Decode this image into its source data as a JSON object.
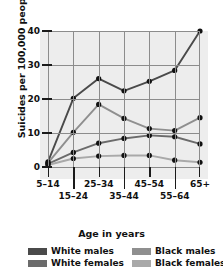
{
  "chart_data": {
    "type": "line",
    "title": "",
    "xlabel": "Age in years",
    "ylabel": "Suicides per 100,000 people",
    "categories": [
      "5–14",
      "15–24",
      "25–34",
      "35–44",
      "45–54",
      "55–64",
      "65+"
    ],
    "yticks": [
      0,
      10,
      20,
      30,
      40
    ],
    "ylim": [
      0,
      40
    ],
    "grid": true,
    "legend_position": "bottom",
    "series": [
      {
        "name": "White males",
        "color": "#4a4a4a",
        "values": [
          1.5,
          20.2,
          26.0,
          22.4,
          25.2,
          28.4,
          40.0
        ]
      },
      {
        "name": "Black males",
        "color": "#8f8f8f",
        "values": [
          1.2,
          10.2,
          18.4,
          14.3,
          11.3,
          10.7,
          14.5
        ]
      },
      {
        "name": "White females",
        "color": "#6b6b6b",
        "values": [
          0.9,
          4.3,
          7.0,
          8.4,
          9.3,
          8.9,
          6.8
        ]
      },
      {
        "name": "Black females",
        "color": "#a9a9a9",
        "values": [
          0.6,
          2.5,
          3.2,
          3.4,
          3.4,
          2.0,
          1.4
        ]
      }
    ]
  },
  "legend": {
    "items": [
      {
        "label": "White males",
        "color": "#4a4a4a"
      },
      {
        "label": "Black males",
        "color": "#8f8f8f"
      },
      {
        "label": "White females",
        "color": "#6b6b6b"
      },
      {
        "label": "Black females",
        "color": "#a9a9a9"
      }
    ]
  },
  "axes": {
    "y_title": "Suicides per 100,000 people",
    "x_title": "Age in years",
    "y_tick_labels": [
      "0",
      "10",
      "20",
      "30",
      "40"
    ],
    "x_tick_labels": [
      "5–14",
      "15–24",
      "25–34",
      "35–44",
      "45–54",
      "55–64",
      "65+"
    ]
  }
}
